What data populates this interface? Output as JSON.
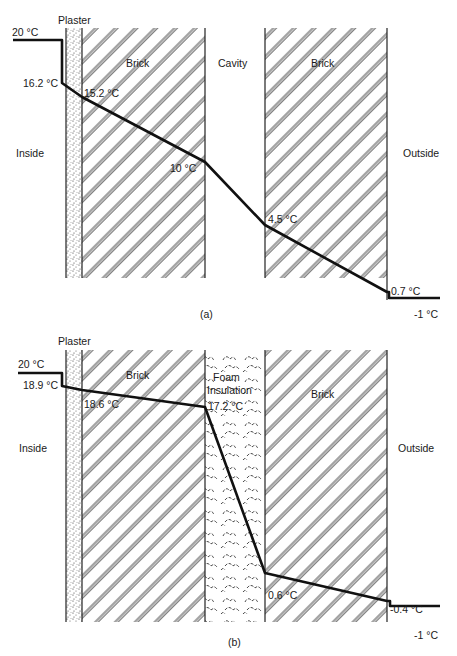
{
  "diagram_a": {
    "caption": "(a)",
    "layers": [
      {
        "name": "Plaster",
        "label": "Plaster"
      },
      {
        "name": "Brick",
        "label": "Brick"
      },
      {
        "name": "Cavity",
        "label": "Cavity"
      },
      {
        "name": "Brick",
        "label": "Brick"
      }
    ],
    "sides": {
      "inside": "Inside",
      "outside": "Outside"
    },
    "temperatures": {
      "inside_air": "20 °C",
      "inner_surface": "16.2 °C",
      "plaster_brick": "15.2 °C",
      "brick_cavity": "10 °C",
      "cavity_brick": "4.5 °C",
      "outer_surface": "0.7 °C",
      "outside_air": "-1 °C"
    }
  },
  "diagram_b": {
    "caption": "(b)",
    "layers": [
      {
        "name": "Plaster",
        "label": "Plaster"
      },
      {
        "name": "Brick",
        "label": "Brick"
      },
      {
        "name": "Foam Insulation",
        "label_line1": "Foam",
        "label_line2": "Insulation"
      },
      {
        "name": "Brick",
        "label": "Brick"
      }
    ],
    "sides": {
      "inside": "Inside",
      "outside": "Outside"
    },
    "temperatures": {
      "inside_air": "20 °C",
      "inner_surface": "18.9 °C",
      "plaster_brick": "18.6 °C",
      "brick_foam": "17.2 °C",
      "foam_brick": "0.6 °C",
      "outer_surface": "-0.4 °C",
      "outside_air": "-1 °C"
    }
  },
  "colors": {
    "ink": "#1a1a1a",
    "background": "#ffffff"
  }
}
